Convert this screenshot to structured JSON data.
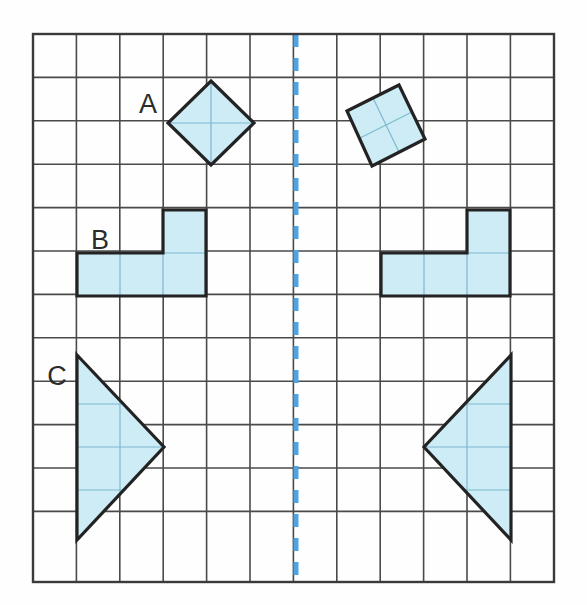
{
  "worksheet": {
    "title": "Reflection on a square grid",
    "kind": "geometry-grid-figure"
  },
  "canvas": {
    "width": 587,
    "height": 605,
    "background": "#fefefe"
  },
  "grid": {
    "origin_x": 33,
    "origin_y": 34,
    "cell": 43.4,
    "cols": 12,
    "rows": 12.63,
    "right": 554,
    "bottom": 582,
    "line_color": "#4a4a4a",
    "line_width": 1.6,
    "border_color": "#3a3a3a",
    "border_width": 2.4
  },
  "mirror_line": {
    "name": "line-of-symmetry",
    "orientation": "vertical",
    "x": 296,
    "y_start": 34,
    "y_end": 582,
    "color": "#4ea3e3",
    "width": 5,
    "dash": "13 11"
  },
  "style": {
    "shape_fill": "#cdecf5",
    "shape_stroke": "#232323",
    "shape_stroke_width": 3.2,
    "inner_grid_stroke": "#7fb8cf",
    "inner_grid_width": 1.2,
    "label_color": "#2b2b2b"
  },
  "labels": [
    {
      "id": "label-a",
      "text": "A",
      "x": 148,
      "y": 113
    },
    {
      "id": "label-b",
      "text": "B",
      "x": 100,
      "y": 249
    },
    {
      "id": "label-c",
      "text": "C",
      "x": 57,
      "y": 385
    }
  ],
  "shapes": [
    {
      "id": "shape-a-original",
      "label": "A",
      "name": "diamond-original",
      "side": "left",
      "type": "polygon",
      "points": "211,81 254,123 211,165 168,123",
      "inner_lines": [
        {
          "x1": 168,
          "y1": 123,
          "x2": 254,
          "y2": 123
        },
        {
          "x1": 211,
          "y1": 81,
          "x2": 211,
          "y2": 165
        }
      ]
    },
    {
      "id": "shape-a-image",
      "label": "A",
      "name": "diamond-image",
      "side": "right",
      "type": "polygon",
      "points": "347,111 399,85 425,139 372,166",
      "inner_lines": [
        {
          "x1": 360,
          "y1": 138,
          "x2": 412,
          "y2": 112
        },
        {
          "x1": 373,
          "y1": 98,
          "x2": 399,
          "y2": 152
        }
      ]
    },
    {
      "id": "shape-b-original",
      "label": "B",
      "name": "l-tetromino-original",
      "side": "left",
      "type": "polygon",
      "points": "77,253 163,253 163,210 206,210 206,296 77,296",
      "inner_lines": [
        {
          "x1": 120,
          "y1": 253,
          "x2": 120,
          "y2": 296
        },
        {
          "x1": 163,
          "y1": 253,
          "x2": 163,
          "y2": 296
        },
        {
          "x1": 163,
          "y1": 253,
          "x2": 206,
          "y2": 253
        }
      ]
    },
    {
      "id": "shape-b-image",
      "label": "B",
      "name": "l-tetromino-image",
      "side": "right",
      "type": "polygon",
      "points": "381,253 467,253 467,210 510,210 510,296 381,296",
      "inner_lines": [
        {
          "x1": 424,
          "y1": 253,
          "x2": 424,
          "y2": 296
        },
        {
          "x1": 467,
          "y1": 253,
          "x2": 467,
          "y2": 296
        },
        {
          "x1": 467,
          "y1": 253,
          "x2": 510,
          "y2": 253
        }
      ]
    },
    {
      "id": "shape-c-original",
      "label": "C",
      "name": "triangle-original",
      "side": "left",
      "type": "polygon",
      "points": "77,355 164,447 77,540",
      "inner_lines": [
        {
          "x1": 77,
          "y1": 404,
          "x2": 122,
          "y2": 404
        },
        {
          "x1": 77,
          "y1": 447,
          "x2": 164,
          "y2": 447
        },
        {
          "x1": 77,
          "y1": 490,
          "x2": 123,
          "y2": 490
        },
        {
          "x1": 120,
          "y1": 401,
          "x2": 120,
          "y2": 493
        }
      ]
    },
    {
      "id": "shape-c-image",
      "label": "C",
      "name": "triangle-image",
      "side": "right",
      "type": "polygon",
      "points": "511,355 424,447 511,540",
      "inner_lines": [
        {
          "x1": 466,
          "y1": 404,
          "x2": 511,
          "y2": 404
        },
        {
          "x1": 424,
          "y1": 447,
          "x2": 511,
          "y2": 447
        },
        {
          "x1": 465,
          "y1": 490,
          "x2": 511,
          "y2": 490
        },
        {
          "x1": 467,
          "y1": 401,
          "x2": 467,
          "y2": 493
        }
      ]
    }
  ]
}
